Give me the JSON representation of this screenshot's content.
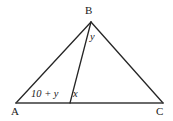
{
  "figure": {
    "type": "triangle-with-cevian",
    "background_color": "#ffffff",
    "stroke_color": "#262626",
    "vertices": {
      "A": {
        "label": "A",
        "x": 16,
        "y": 103
      },
      "B": {
        "label": "B",
        "x": 91,
        "y": 22
      },
      "C": {
        "label": "C",
        "x": 163,
        "y": 103
      },
      "D": {
        "label": "",
        "x": 70,
        "y": 103
      }
    },
    "segments": [
      {
        "name": "side-ab",
        "from": "A",
        "to": "B"
      },
      {
        "name": "side-bc",
        "from": "B",
        "to": "C"
      },
      {
        "name": "base-ac",
        "from": "A",
        "to": "C"
      },
      {
        "name": "cevian-bd",
        "from": "B",
        "to": "D"
      }
    ],
    "labels": {
      "vertex_a": "A",
      "vertex_b": "B",
      "vertex_c": "C",
      "angle_at_b": "y",
      "angle_at_a": "10 + y",
      "angle_at_d": "x"
    }
  }
}
